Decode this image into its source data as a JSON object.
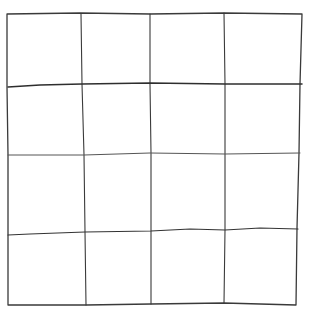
{
  "diagram": {
    "type": "hand-drawn grid",
    "rows": 4,
    "columns": 4,
    "stroke_color": "#3a3a3a",
    "background_color": "#ffffff",
    "outline": {
      "top_left": [
        7,
        14
      ],
      "top_right": [
        302,
        14
      ],
      "bottom_right": [
        296,
        305
      ],
      "bottom_left": [
        8,
        305
      ]
    },
    "vertical_lines": [
      {
        "top": [
          81,
          14
        ],
        "bottom": [
          86,
          305
        ]
      },
      {
        "top": [
          150,
          14
        ],
        "bottom": [
          151,
          304
        ]
      },
      {
        "top": [
          224,
          13
        ],
        "bottom": [
          224,
          303
        ]
      }
    ],
    "horizontal_lines": [
      {
        "left": [
          8,
          87
        ],
        "mid": [
          82,
          84
        ],
        "right": [
          302,
          84
        ]
      },
      {
        "left": [
          8,
          155
        ],
        "mid": [
          150,
          153
        ],
        "right": [
          300,
          153
        ]
      },
      {
        "left": [
          8,
          235
        ],
        "mid": [
          85,
          232
        ],
        "right": [
          298,
          228
        ]
      }
    ]
  }
}
